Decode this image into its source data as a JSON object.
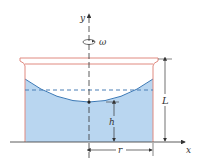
{
  "diagram": {
    "labels": {
      "y_axis": "y",
      "x_axis": "x",
      "omega": "ω",
      "height_L": "L",
      "height_h": "h",
      "radius_r": "r"
    },
    "colors": {
      "container_outline": "#e08a80",
      "liquid_fill": "#b9d6f0",
      "surface_line": "#3a78b5",
      "axis": "#333333",
      "dashed": "#4a7fb5"
    }
  }
}
